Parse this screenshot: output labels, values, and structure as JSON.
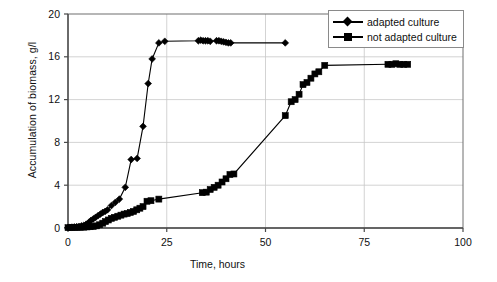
{
  "chart_data": {
    "type": "scatter",
    "title": "",
    "xlabel": "Time, hours",
    "ylabel": "Accumulation of biomass, g/l",
    "xlim": [
      0,
      100
    ],
    "ylim": [
      0,
      20
    ],
    "xticks": [
      "0",
      "25",
      "50",
      "75",
      "100"
    ],
    "yticks": [
      "0",
      "4",
      "8",
      "12",
      "16",
      "20"
    ],
    "xtick_values": [
      0,
      25,
      50,
      75,
      100
    ],
    "ytick_values": [
      0,
      4,
      8,
      12,
      16,
      20
    ],
    "grid": "horizontal-and-vertical",
    "grid_color": "#c8c8c8",
    "legend_position": "top-right",
    "series": [
      {
        "name": "adapted culture",
        "marker": "diamond",
        "color": "#000000",
        "x": [
          0,
          0.5,
          1,
          1.6,
          2.2,
          2.8,
          3.4,
          4,
          4.6,
          5.2,
          5.8,
          6.4,
          7,
          7.6,
          8.2,
          8.8,
          9.4,
          10,
          11,
          12,
          13,
          14.5,
          16,
          17.5,
          19,
          20.3,
          21.3,
          23,
          24.5,
          33,
          33.6,
          34.2,
          34.8,
          35.4,
          36,
          37.6,
          38.2,
          38.8,
          39.4,
          40,
          40.6,
          41.2,
          55
        ],
        "y": [
          0.05,
          0.06,
          0.08,
          0.1,
          0.12,
          0.15,
          0.2,
          0.25,
          0.35,
          0.5,
          0.7,
          0.85,
          1.0,
          1.15,
          1.3,
          1.45,
          1.55,
          1.7,
          2.1,
          2.4,
          2.7,
          3.8,
          6.4,
          6.5,
          9.5,
          13.5,
          15.8,
          17.3,
          17.45,
          17.5,
          17.55,
          17.5,
          17.5,
          17.5,
          17.45,
          17.5,
          17.5,
          17.45,
          17.4,
          17.35,
          17.3,
          17.3,
          17.3
        ]
      },
      {
        "name": "not adapted culture",
        "marker": "square",
        "color": "#000000",
        "x": [
          0,
          0.8,
          1.6,
          2.4,
          3.2,
          4,
          4.8,
          5.6,
          6.4,
          7.2,
          8,
          8.8,
          9.5,
          10.2,
          11,
          11.8,
          12.6,
          13.4,
          14.2,
          15,
          15.8,
          16.6,
          17.4,
          18.2,
          19,
          20,
          21,
          23,
          34,
          35,
          36,
          37,
          38,
          39,
          40,
          41,
          42,
          55,
          56.5,
          57.5,
          58.5,
          59.5,
          60.5,
          61.5,
          62.5,
          63.5,
          65,
          81,
          82,
          83,
          84,
          85,
          86
        ],
        "y": [
          0.03,
          0.04,
          0.05,
          0.06,
          0.07,
          0.08,
          0.1,
          0.12,
          0.15,
          0.2,
          0.3,
          0.45,
          0.6,
          0.75,
          0.9,
          1.0,
          1.1,
          1.2,
          1.3,
          1.35,
          1.45,
          1.55,
          1.7,
          1.85,
          2.0,
          2.5,
          2.55,
          2.7,
          3.3,
          3.35,
          3.6,
          3.8,
          4.0,
          4.3,
          4.6,
          5.0,
          5.05,
          10.5,
          11.8,
          12.0,
          12.5,
          13.4,
          13.6,
          14.0,
          14.4,
          14.6,
          15.2,
          15.3,
          15.3,
          15.35,
          15.3,
          15.3,
          15.3
        ]
      }
    ]
  },
  "legend": {
    "entries": [
      {
        "label": "adapted culture",
        "marker": "diamond-marker-icon"
      },
      {
        "label": "not adapted culture",
        "marker": "square-marker-icon"
      }
    ]
  }
}
